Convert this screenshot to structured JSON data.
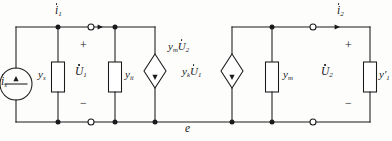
{
  "diagram": {
    "ground_rail_label": "e",
    "stroke_color": "#1a1a1c",
    "background_color": "#fdfdfc"
  },
  "labels": {
    "current_source": {
      "symbol": "i",
      "subscript": "s",
      "dotted": true
    },
    "input_current": {
      "symbol": "i",
      "subscript": "1",
      "dotted": true
    },
    "output_current": {
      "symbol": "i",
      "subscript": "2",
      "dotted": true
    },
    "input_voltage": {
      "symbol": "U",
      "subscript": "1",
      "dotted": true
    },
    "output_voltage": {
      "symbol": "U",
      "subscript": "2",
      "dotted": true
    },
    "source_admittance": {
      "symbol": "y",
      "subscript": "s",
      "dotted": false
    },
    "input_shunt_admittance": {
      "symbol": "y",
      "subscript": "ii",
      "dotted": false
    },
    "output_shunt_admittance": {
      "symbol": "y",
      "subscript": "m",
      "dotted": false
    },
    "load_admittance": {
      "symbol": "y",
      "subscript": "1",
      "prime": true,
      "dotted": false
    },
    "ccs_right_of_input": {
      "gain_symbol": "y",
      "gain_subscript": "m",
      "voltage_symbol": "U",
      "voltage_subscript": "2",
      "voltage_dotted": true
    },
    "ccs_left_of_output": {
      "gain_symbol": "y",
      "gain_subscript": "k",
      "voltage_symbol": "U",
      "voltage_subscript": "1",
      "voltage_dotted": true
    },
    "polarity_plus": "+",
    "polarity_minus": "−"
  },
  "components": [
    {
      "name": "independent-current-source",
      "type": "circle-source",
      "side": "left"
    },
    {
      "name": "source-admittance-box",
      "type": "rectangle-element"
    },
    {
      "name": "input-shunt-admittance-box",
      "type": "rectangle-element"
    },
    {
      "name": "dependent-source-ymu2",
      "type": "diamond-source"
    },
    {
      "name": "dependent-source-yku1",
      "type": "diamond-source"
    },
    {
      "name": "output-shunt-admittance-box",
      "type": "rectangle-element"
    },
    {
      "name": "load-admittance-box",
      "type": "rectangle-element"
    }
  ],
  "terminals": {
    "open_circle_count": 4,
    "junction_dot_count": 8
  }
}
